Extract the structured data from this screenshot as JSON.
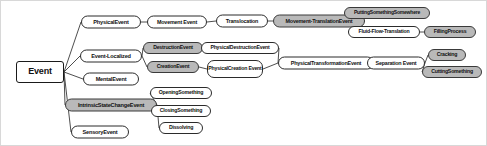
{
  "diagram": {
    "background_color": "#ffffff",
    "edge_color": "#3a3a3a",
    "node_fill": "#ffffff",
    "node_shaded_fill": "#b9b9b9",
    "node_border_color": "#2b2b2b",
    "text_color": "#111111"
  },
  "chart_data": {
    "type": "tree",
    "nodes": [
      {
        "id": "event",
        "label": "Event",
        "shaded": false,
        "x": 39,
        "y": 71,
        "w": 48,
        "h": 22,
        "fs": 9,
        "shape": "rect"
      },
      {
        "id": "physical_event",
        "label": "PhysicalEvent",
        "shaded": false,
        "x": 110,
        "y": 21,
        "w": 60,
        "h": 13,
        "fs": 5.6,
        "shape": "rounded"
      },
      {
        "id": "event_localized",
        "label": "Event-Localized",
        "shaded": false,
        "x": 110,
        "y": 55,
        "w": 62,
        "h": 13,
        "fs": 5.6,
        "shape": "rounded"
      },
      {
        "id": "mental_event",
        "label": "MentalEvent",
        "shaded": false,
        "x": 110,
        "y": 78,
        "w": 56,
        "h": 13,
        "fs": 5.6,
        "shape": "rounded"
      },
      {
        "id": "intrinsic_state_change",
        "label": "IntrinsicStateChangeEvent",
        "shaded": true,
        "x": 110,
        "y": 104,
        "w": 92,
        "h": 13,
        "fs": 5.6,
        "shape": "rounded"
      },
      {
        "id": "sensory_event",
        "label": "SensoryEvent",
        "shaded": false,
        "x": 99,
        "y": 131,
        "w": 58,
        "h": 13,
        "fs": 5.6,
        "shape": "rounded"
      },
      {
        "id": "movement_event",
        "label": "Movement Event",
        "shaded": false,
        "x": 176,
        "y": 21,
        "w": 60,
        "h": 13,
        "fs": 5.4,
        "shape": "rounded"
      },
      {
        "id": "destruction_event",
        "label": "DestructionEvent",
        "shaded": true,
        "x": 172,
        "y": 47,
        "w": 60,
        "h": 12,
        "fs": 5.2,
        "shape": "rounded"
      },
      {
        "id": "creation_event",
        "label": "CreationEvent",
        "shaded": true,
        "x": 172,
        "y": 66,
        "w": 52,
        "h": 12,
        "fs": 5.2,
        "shape": "rounded"
      },
      {
        "id": "opening_something",
        "label": "OpeningSomething",
        "shaded": false,
        "x": 180,
        "y": 92,
        "w": 62,
        "h": 12,
        "fs": 5.2,
        "shape": "rounded"
      },
      {
        "id": "closing_something",
        "label": "ClosingSomething",
        "shaded": false,
        "x": 180,
        "y": 110,
        "w": 60,
        "h": 12,
        "fs": 5.2,
        "shape": "rounded"
      },
      {
        "id": "dissolving",
        "label": "Dissolving",
        "shaded": false,
        "x": 180,
        "y": 127,
        "w": 44,
        "h": 12,
        "fs": 5.2,
        "shape": "rounded"
      },
      {
        "id": "translocation",
        "label": "Translocation",
        "shaded": false,
        "x": 241,
        "y": 20,
        "w": 52,
        "h": 13,
        "fs": 5.4,
        "shape": "rounded"
      },
      {
        "id": "physical_destruction",
        "label": "PhysicalDestructionEvent",
        "shaded": false,
        "x": 239,
        "y": 47,
        "w": 78,
        "h": 12,
        "fs": 5.2,
        "shape": "rounded"
      },
      {
        "id": "physical_creation",
        "label": "PhysicalCreation Event",
        "shaded": false,
        "x": 234,
        "y": 68,
        "w": 56,
        "h": 18,
        "fs": 5.2,
        "shape": "rounded",
        "wrap": true
      },
      {
        "id": "movement_translation",
        "label": "Movement-TranslationEvent",
        "shaded": true,
        "x": 318,
        "y": 20,
        "w": 92,
        "h": 13,
        "fs": 5.4,
        "shape": "rounded"
      },
      {
        "id": "physical_transformation",
        "label": "PhysicalTransformationEvent",
        "shaded": false,
        "x": 325,
        "y": 62,
        "w": 96,
        "h": 13,
        "fs": 5.4,
        "shape": "rounded"
      },
      {
        "id": "putting_something_somewhere",
        "label": "PuttingSomethingSomewhere",
        "shaded": true,
        "x": 386,
        "y": 12,
        "w": 86,
        "h": 12,
        "fs": 5.0,
        "shape": "rounded"
      },
      {
        "id": "fluid_flow_translation",
        "label": "Fluid-Flow-Translation",
        "shaded": false,
        "x": 383,
        "y": 31,
        "w": 72,
        "h": 12,
        "fs": 5.2,
        "shape": "rounded"
      },
      {
        "id": "separation_event",
        "label": "Separation Event",
        "shaded": false,
        "x": 395,
        "y": 62,
        "w": 58,
        "h": 13,
        "fs": 5.4,
        "shape": "rounded"
      },
      {
        "id": "filling_process",
        "label": "FillingProcess",
        "shaded": true,
        "x": 449,
        "y": 31,
        "w": 52,
        "h": 12,
        "fs": 5.2,
        "shape": "rounded"
      },
      {
        "id": "cracking",
        "label": "Cracking",
        "shaded": true,
        "x": 446,
        "y": 54,
        "w": 38,
        "h": 12,
        "fs": 5.2,
        "shape": "rounded"
      },
      {
        "id": "cutting_something",
        "label": "CuttingSomething",
        "shaded": true,
        "x": 451,
        "y": 71,
        "w": 60,
        "h": 12,
        "fs": 5.2,
        "shape": "rounded"
      }
    ],
    "edges": [
      {
        "from": "event",
        "to": "physical_event"
      },
      {
        "from": "event",
        "to": "event_localized"
      },
      {
        "from": "event",
        "to": "mental_event"
      },
      {
        "from": "event",
        "to": "intrinsic_state_change"
      },
      {
        "from": "event",
        "to": "sensory_event"
      },
      {
        "from": "physical_event",
        "to": "movement_event"
      },
      {
        "from": "event_localized",
        "to": "destruction_event"
      },
      {
        "from": "event_localized",
        "to": "creation_event"
      },
      {
        "from": "intrinsic_state_change",
        "to": "opening_something"
      },
      {
        "from": "intrinsic_state_change",
        "to": "closing_something"
      },
      {
        "from": "intrinsic_state_change",
        "to": "dissolving"
      },
      {
        "from": "movement_event",
        "to": "translocation"
      },
      {
        "from": "destruction_event",
        "to": "physical_destruction"
      },
      {
        "from": "creation_event",
        "to": "physical_creation"
      },
      {
        "from": "translocation",
        "to": "movement_translation"
      },
      {
        "from": "physical_destruction",
        "to": "physical_transformation"
      },
      {
        "from": "physical_creation",
        "to": "physical_transformation"
      },
      {
        "from": "movement_translation",
        "to": "putting_something_somewhere"
      },
      {
        "from": "movement_translation",
        "to": "fluid_flow_translation"
      },
      {
        "from": "fluid_flow_translation",
        "to": "filling_process"
      },
      {
        "from": "physical_transformation",
        "to": "separation_event"
      },
      {
        "from": "separation_event",
        "to": "cracking"
      },
      {
        "from": "separation_event",
        "to": "cutting_something"
      }
    ]
  }
}
